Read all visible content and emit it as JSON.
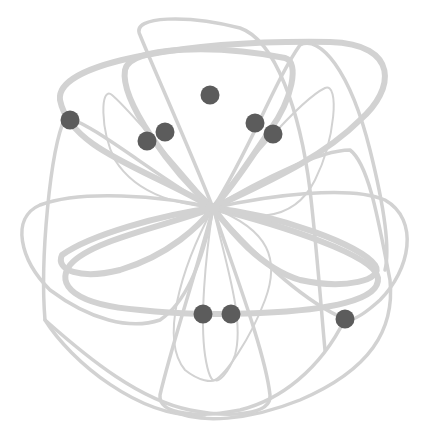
{
  "diagram": {
    "title": "",
    "center": {
      "x": 213,
      "y": 208
    },
    "colors": {
      "background": "#ffffff",
      "loop_stroke": "#d2d2d2",
      "node_fill": "#5c5c5c"
    },
    "loops": [
      {
        "id": "outer-top",
        "weight": "thick",
        "d": "M213,208 C150,170 70,150 60,100 C55,60 200,40 330,42 C400,44 395,90 360,120 C320,160 260,185 213,208"
      },
      {
        "id": "inner-top",
        "weight": "thick",
        "d": "M213,208 C170,170 120,100 125,70 C130,45 220,45 285,58 C300,62 292,100 270,130 C250,160 230,190 213,208"
      },
      {
        "id": "thin-upper-left",
        "weight": "thin",
        "d": "M213,208 C180,170 130,110 112,95 C100,85 100,130 115,160 C140,200 190,205 213,208"
      },
      {
        "id": "thin-upper-right",
        "weight": "thin",
        "d": "M213,208 C240,170 300,100 325,88 C340,82 335,140 315,180 C290,230 240,215 213,208"
      },
      {
        "id": "top-arch",
        "weight": "medium",
        "d": "M213,208 C190,150 150,60 140,35 C130,15 190,15 240,28 C275,40 300,110 310,190 C318,260 322,320 325,350"
      },
      {
        "id": "left-arch",
        "weight": "medium",
        "d": "M213,208 C160,180 90,120 65,118 C50,150 40,260 45,320 C70,360 140,420 205,415"
      },
      {
        "id": "left-wide",
        "weight": "medium",
        "d": "M213,208 C160,195 80,190 40,205 C10,218 20,260 50,290 C90,320 130,330 160,320 C190,300 205,250 213,208"
      },
      {
        "id": "lower-left-thick",
        "weight": "thick",
        "d": "M213,208 C170,225 90,240 70,265 C55,285 75,305 140,310 C180,314 205,315 260,313 C330,310 380,300 378,278 C375,255 280,225 213,208"
      },
      {
        "id": "mid-left-thick",
        "weight": "thick",
        "d": "M213,208 C160,215 90,235 62,255 C55,270 80,280 120,270 C170,255 200,225 213,208"
      },
      {
        "id": "right-thick",
        "weight": "thick",
        "d": "M213,208 C280,215 360,245 375,265 C385,280 345,290 300,280 C260,268 230,230 213,208"
      },
      {
        "id": "right-wide",
        "weight": "medium",
        "d": "M213,208 C270,195 350,185 385,200 C420,220 410,270 380,300 C360,318 350,322 345,319 C300,300 250,250 213,208"
      },
      {
        "id": "right-arch",
        "weight": "medium",
        "d": "M213,208 C260,180 320,150 350,150 C370,165 380,230 390,280 C395,330 370,370 300,400 C250,420 200,425 170,410"
      },
      {
        "id": "upper-right-arch",
        "weight": "medium",
        "d": "M213,208 C250,150 275,80 300,45 C320,35 350,70 370,150 C385,210 390,250 385,270"
      },
      {
        "id": "bottom-left-loop",
        "weight": "medium",
        "d": "M213,208 C200,260 170,350 160,395 C158,415 200,418 240,410 C280,400 320,370 345,319"
      },
      {
        "id": "bottom-right-loop",
        "weight": "medium",
        "d": "M213,208 C230,260 265,350 270,395 C272,415 230,418 190,410 C140,400 90,360 45,320"
      },
      {
        "id": "bottom-thin-left",
        "weight": "thin",
        "d": "M213,208 C205,260 200,320 205,355 C208,375 212,382 215,380"
      },
      {
        "id": "bottom-thin-right",
        "weight": "thin",
        "d": "M213,208 C225,260 245,320 235,355 C228,375 218,382 215,380"
      },
      {
        "id": "bottom-thin-outer",
        "weight": "thin",
        "d": "M213,208 C180,270 160,340 185,370 C200,382 212,382 215,380 C225,375 250,340 265,300 C280,260 270,230 213,208"
      }
    ],
    "nodes": [
      {
        "id": "node-1",
        "x": 70,
        "y": 120
      },
      {
        "id": "node-2",
        "x": 147,
        "y": 141
      },
      {
        "id": "node-3",
        "x": 165,
        "y": 132
      },
      {
        "id": "node-4",
        "x": 210,
        "y": 95
      },
      {
        "id": "node-5",
        "x": 255,
        "y": 123
      },
      {
        "id": "node-6",
        "x": 273,
        "y": 134
      },
      {
        "id": "node-7",
        "x": 203,
        "y": 314
      },
      {
        "id": "node-8",
        "x": 231,
        "y": 314
      },
      {
        "id": "node-9",
        "x": 345,
        "y": 319
      }
    ],
    "node_radius": 9.5,
    "stroke_widths": {
      "thick": 6,
      "medium": 3.5,
      "thin": 2
    }
  }
}
